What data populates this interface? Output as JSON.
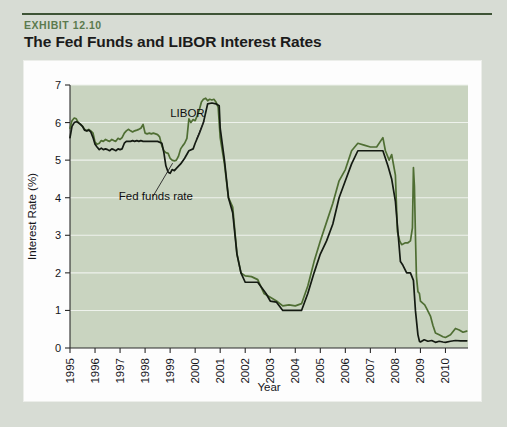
{
  "exhibit": {
    "label": "EXHIBIT 12.10",
    "title": "The Fed Funds and LIBOR Interest Rates"
  },
  "colors": {
    "page_background": "#d7dcd4",
    "card_background": "#fdfdfd",
    "plot_background": "#c9d4c0",
    "rule": "#3e5436",
    "exhibit_label": "#5b7a4e",
    "libor_line": "#4f6e33",
    "fed_funds_line": "#141a12",
    "gridline": "#eef2ec"
  },
  "chart_data": {
    "type": "line",
    "title": "The Fed Funds and LIBOR Interest Rates",
    "xlabel": "Year",
    "ylabel": "Interest Rate (%)",
    "xlim": [
      1995,
      2010.9
    ],
    "ylim": [
      0,
      7
    ],
    "yticks": [
      0,
      1,
      2,
      3,
      4,
      5,
      6,
      7
    ],
    "xticks": [
      1995,
      1996,
      1997,
      1998,
      1999,
      2000,
      2001,
      2002,
      2003,
      2004,
      2005,
      2006,
      2007,
      2008,
      2009,
      2010
    ],
    "xtick_labels": [
      "1995",
      "1996",
      "1997",
      "1998",
      "1999",
      "2000",
      "2001",
      "2002",
      "2003",
      "2004",
      "2005",
      "2006",
      "2007",
      "2008",
      "2009",
      "2010"
    ],
    "grid": true,
    "grid_axis": "y",
    "legend": "annotations",
    "annotations": [
      {
        "text": "LIBOR",
        "series": "LIBOR",
        "label_x": 1999.0,
        "label_y": 6.15,
        "point_x": 2000.05,
        "point_y": 5.55
      },
      {
        "text": "Fed funds rate",
        "series": "Fed funds rate",
        "label_x": 1996.95,
        "label_y": 3.95,
        "point_x": 1999.1,
        "point_y": 4.92
      }
    ],
    "series": [
      {
        "name": "LIBOR",
        "color": "#4f6e33",
        "x": [
          1995.0,
          1995.08,
          1995.17,
          1995.25,
          1995.33,
          1995.42,
          1995.5,
          1995.58,
          1995.67,
          1995.75,
          1995.83,
          1995.92,
          1996.0,
          1996.08,
          1996.17,
          1996.25,
          1996.33,
          1996.42,
          1996.5,
          1996.58,
          1996.67,
          1996.75,
          1996.83,
          1996.92,
          1997.0,
          1997.08,
          1997.17,
          1997.25,
          1997.33,
          1997.42,
          1997.5,
          1997.58,
          1997.67,
          1997.75,
          1997.83,
          1997.92,
          1998.0,
          1998.08,
          1998.17,
          1998.25,
          1998.33,
          1998.42,
          1998.5,
          1998.58,
          1998.67,
          1998.75,
          1998.83,
          1998.92,
          1999.0,
          1999.08,
          1999.17,
          1999.25,
          1999.33,
          1999.42,
          1999.5,
          1999.58,
          1999.67,
          1999.75,
          1999.83,
          1999.92,
          2000.0,
          2000.08,
          2000.17,
          2000.25,
          2000.33,
          2000.42,
          2000.5,
          2000.58,
          2000.67,
          2000.75,
          2000.83,
          2000.92,
          2001.0,
          2001.17,
          2001.33,
          2001.5,
          2001.67,
          2001.83,
          2002.0,
          2002.25,
          2002.5,
          2002.75,
          2003.0,
          2003.25,
          2003.5,
          2003.75,
          2004.0,
          2004.25,
          2004.5,
          2004.75,
          2005.0,
          2005.25,
          2005.5,
          2005.75,
          2006.0,
          2006.25,
          2006.5,
          2006.75,
          2007.0,
          2007.25,
          2007.5,
          2007.6,
          2007.75,
          2007.85,
          2008.0,
          2008.08,
          2008.17,
          2008.25,
          2008.4,
          2008.5,
          2008.6,
          2008.68,
          2008.72,
          2008.76,
          2008.8,
          2008.84,
          2008.9,
          2008.96,
          2009.0,
          2009.08,
          2009.17,
          2009.25,
          2009.4,
          2009.5,
          2009.6,
          2009.75,
          2009.9,
          2010.0,
          2010.2,
          2010.4,
          2010.55,
          2010.7,
          2010.85
        ],
        "y": [
          5.85,
          6.05,
          6.12,
          6.1,
          6.0,
          5.95,
          5.9,
          5.82,
          5.78,
          5.82,
          5.78,
          5.72,
          5.48,
          5.42,
          5.45,
          5.52,
          5.5,
          5.55,
          5.52,
          5.5,
          5.55,
          5.52,
          5.5,
          5.58,
          5.55,
          5.6,
          5.72,
          5.78,
          5.82,
          5.78,
          5.75,
          5.78,
          5.8,
          5.82,
          5.85,
          5.95,
          5.72,
          5.7,
          5.72,
          5.7,
          5.72,
          5.7,
          5.68,
          5.62,
          5.38,
          5.25,
          5.2,
          5.18,
          5.05,
          5.0,
          4.98,
          5.0,
          5.1,
          5.3,
          5.38,
          5.45,
          5.58,
          6.1,
          6.0,
          6.08,
          6.05,
          6.18,
          6.35,
          6.55,
          6.62,
          6.65,
          6.58,
          6.62,
          6.6,
          6.62,
          6.55,
          6.4,
          5.6,
          4.9,
          4.0,
          3.75,
          2.5,
          2.0,
          1.92,
          1.9,
          1.82,
          1.45,
          1.35,
          1.25,
          1.12,
          1.15,
          1.12,
          1.18,
          1.65,
          2.3,
          2.85,
          3.35,
          3.85,
          4.45,
          4.75,
          5.25,
          5.45,
          5.4,
          5.35,
          5.35,
          5.6,
          5.25,
          5.0,
          5.15,
          4.6,
          3.1,
          2.85,
          2.75,
          2.8,
          2.8,
          2.85,
          3.2,
          4.8,
          4.3,
          3.0,
          1.9,
          1.5,
          1.45,
          1.25,
          1.2,
          1.15,
          1.05,
          0.85,
          0.6,
          0.4,
          0.35,
          0.3,
          0.28,
          0.35,
          0.52,
          0.48,
          0.42,
          0.45
        ]
      },
      {
        "name": "Fed funds rate",
        "color": "#141a12",
        "x": [
          1995.0,
          1995.08,
          1995.17,
          1995.25,
          1995.33,
          1995.42,
          1995.5,
          1995.58,
          1995.67,
          1995.75,
          1995.83,
          1995.92,
          1996.0,
          1996.08,
          1996.17,
          1996.25,
          1996.33,
          1996.42,
          1996.5,
          1996.58,
          1996.67,
          1996.75,
          1996.83,
          1996.92,
          1997.0,
          1997.08,
          1997.17,
          1997.25,
          1997.33,
          1997.42,
          1997.5,
          1997.58,
          1997.67,
          1997.75,
          1997.83,
          1997.92,
          1998.0,
          1998.17,
          1998.33,
          1998.5,
          1998.67,
          1998.75,
          1998.83,
          1998.92,
          1999.0,
          1999.08,
          1999.17,
          1999.25,
          1999.42,
          1999.58,
          1999.75,
          1999.92,
          2000.0,
          2000.17,
          2000.33,
          2000.5,
          2000.67,
          2000.83,
          2000.96,
          2001.0,
          2001.17,
          2001.33,
          2001.5,
          2001.67,
          2001.83,
          2002.0,
          2002.25,
          2002.5,
          2002.83,
          2003.0,
          2003.25,
          2003.5,
          2003.75,
          2004.0,
          2004.25,
          2004.5,
          2004.75,
          2005.0,
          2005.25,
          2005.5,
          2005.75,
          2006.0,
          2006.25,
          2006.5,
          2006.75,
          2007.0,
          2007.25,
          2007.5,
          2007.7,
          2007.85,
          2008.0,
          2008.1,
          2008.2,
          2008.3,
          2008.45,
          2008.6,
          2008.72,
          2008.8,
          2008.9,
          2008.96,
          2009.0,
          2009.15,
          2009.3,
          2009.45,
          2009.6,
          2009.75,
          2009.9,
          2010.0,
          2010.2,
          2010.4,
          2010.6,
          2010.85
        ],
        "y": [
          5.6,
          5.9,
          6.0,
          6.02,
          6.0,
          5.95,
          5.9,
          5.8,
          5.78,
          5.8,
          5.75,
          5.6,
          5.42,
          5.35,
          5.28,
          5.32,
          5.28,
          5.3,
          5.28,
          5.25,
          5.3,
          5.28,
          5.25,
          5.3,
          5.28,
          5.3,
          5.45,
          5.5,
          5.5,
          5.5,
          5.52,
          5.5,
          5.52,
          5.5,
          5.52,
          5.5,
          5.5,
          5.5,
          5.5,
          5.5,
          5.45,
          5.2,
          4.85,
          4.68,
          4.65,
          4.75,
          4.72,
          4.78,
          4.9,
          5.05,
          5.25,
          5.3,
          5.45,
          5.72,
          6.0,
          6.5,
          6.52,
          6.5,
          6.45,
          5.85,
          5.0,
          4.0,
          3.6,
          2.5,
          2.0,
          1.75,
          1.75,
          1.75,
          1.45,
          1.25,
          1.22,
          1.0,
          1.0,
          1.0,
          1.0,
          1.45,
          2.0,
          2.5,
          2.85,
          3.3,
          4.0,
          4.45,
          4.9,
          5.25,
          5.25,
          5.25,
          5.25,
          5.25,
          4.85,
          4.5,
          3.9,
          3.1,
          2.3,
          2.2,
          2.0,
          2.0,
          1.8,
          1.0,
          0.35,
          0.18,
          0.16,
          0.22,
          0.18,
          0.2,
          0.15,
          0.18,
          0.16,
          0.15,
          0.18,
          0.2,
          0.19,
          0.19
        ]
      }
    ]
  }
}
